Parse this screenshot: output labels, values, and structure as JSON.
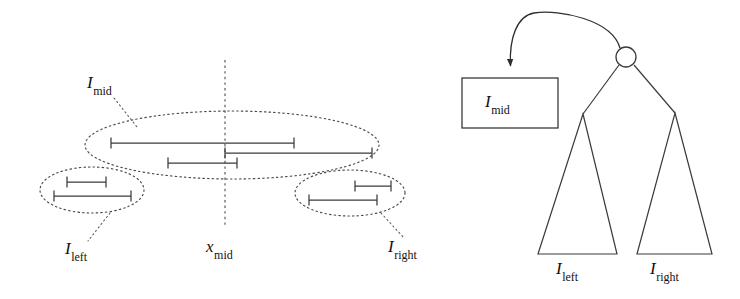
{
  "figure": {
    "stroke_color": "#3a3a3a",
    "dotted_color": "#4a4a4a",
    "text_color": "#111111",
    "background": "#ffffff"
  },
  "left_panel": {
    "labels": {
      "i_mid": {
        "base": "I",
        "sub": "mid"
      },
      "i_left": {
        "base": "I",
        "sub": "left"
      },
      "i_right": {
        "base": "I",
        "sub": "right"
      },
      "x_mid": {
        "base": "x",
        "sub": "mid"
      }
    },
    "split_line": {
      "name": "x_mid",
      "x": 225,
      "y_top": 60,
      "y_bottom": 225
    },
    "groups": [
      {
        "name": "I_mid",
        "ellipse": {
          "cx": 232,
          "cy": 145,
          "rx": 147,
          "ry": 34
        },
        "intervals": [
          {
            "x1": 111,
            "x2": 294,
            "y": 143
          },
          {
            "x1": 225,
            "x2": 372,
            "y": 153
          },
          {
            "x1": 168,
            "x2": 237,
            "y": 163
          }
        ]
      },
      {
        "name": "I_left",
        "ellipse": {
          "cx": 92,
          "cy": 190,
          "rx": 52,
          "ry": 23
        },
        "intervals": [
          {
            "x1": 67,
            "x2": 106,
            "y": 182
          },
          {
            "x1": 54,
            "x2": 131,
            "y": 196
          }
        ]
      },
      {
        "name": "I_right",
        "ellipse": {
          "cx": 350,
          "cy": 193,
          "rx": 55,
          "ry": 23
        },
        "intervals": [
          {
            "x1": 355,
            "x2": 391,
            "y": 186
          },
          {
            "x1": 309,
            "x2": 377,
            "y": 200
          }
        ]
      }
    ]
  },
  "right_panel": {
    "labels": {
      "i_mid": {
        "base": "I",
        "sub": "mid"
      },
      "i_left": {
        "base": "I",
        "sub": "left"
      },
      "i_right": {
        "base": "I",
        "sub": "right"
      }
    },
    "node": {
      "cx": 626,
      "cy": 57,
      "r": 10
    },
    "box": {
      "x": 462,
      "y": 78,
      "width": 96,
      "height": 50
    },
    "arrow": {
      "from_x": 620,
      "from_y": 47,
      "to_x": 511,
      "to_y": 74
    },
    "subtrees": [
      {
        "name": "I_left",
        "apex_x": 583,
        "apex_y": 114,
        "base_left": 538,
        "base_right": 617,
        "base_y": 254
      },
      {
        "name": "I_right",
        "apex_x": 675,
        "apex_y": 113,
        "base_left": 637,
        "base_right": 712,
        "base_y": 254
      }
    ]
  }
}
